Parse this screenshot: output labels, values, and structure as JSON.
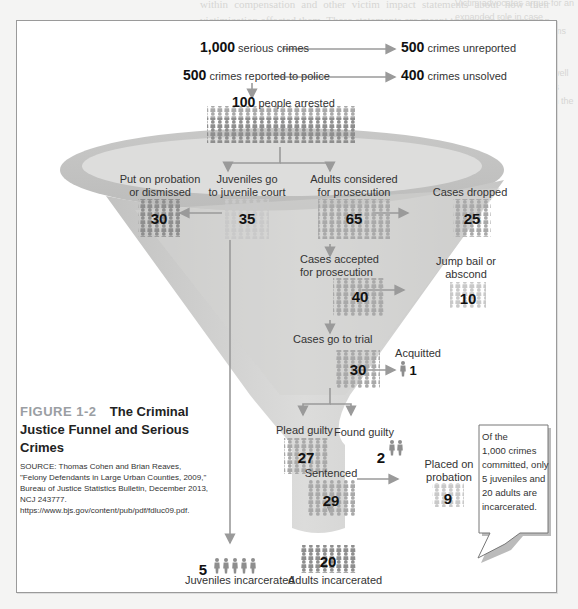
{
  "background_page": {
    "visible": "faded bleed-through of surrounding book page text"
  },
  "figure": {
    "number": "FIGURE 1-2",
    "title": "The Criminal Justice Funnel and Serious Crimes",
    "source": "SOURCE: Thomas Cohen and Brian Reaves, \"Felony Defendants in Large Urban Counties, 2009,\" Bureau of Justice Statistics Bulletin, December 2013, NCJ 243777. https://www.bjs.gov/content/pub/pdf/fdluc09.pdf."
  },
  "flow": {
    "serious_crimes": {
      "value": "1,000",
      "label": "serious crimes"
    },
    "unreported": {
      "value": "500",
      "label": "crimes unreported"
    },
    "reported": {
      "value": "500",
      "label": "crimes reported to police"
    },
    "unsolved": {
      "value": "400",
      "label": "crimes unsolved"
    },
    "arrested": {
      "value": "100",
      "label": "people arrested"
    },
    "probation_dismissed": {
      "value": "30",
      "label_line1": "Put on probation",
      "label_line2": "or dismissed"
    },
    "juvenile_court": {
      "value": "35",
      "label_line1": "Juveniles go",
      "label_line2": "to juvenile court"
    },
    "adults_considered": {
      "value": "65",
      "label_line1": "Adults considered",
      "label_line2": "for prosecution"
    },
    "cases_dropped": {
      "value": "25",
      "label": "Cases dropped"
    },
    "cases_accepted": {
      "value": "40",
      "label_line1": "Cases accepted",
      "label_line2": "for prosecution"
    },
    "jump_bail": {
      "value": "10",
      "label_line1": "Jump bail or",
      "label_line2": "abscond"
    },
    "go_to_trial": {
      "value": "30",
      "label": "Cases go to trial"
    },
    "acquitted": {
      "value": "1",
      "label": "Acquitted"
    },
    "plead_guilty": {
      "value": "27",
      "label": "Plead guilty"
    },
    "found_guilty": {
      "value": "2",
      "label": "Found guilty"
    },
    "sentenced": {
      "value": "29",
      "label": "Sentenced"
    },
    "placed_on_probation": {
      "value": "9",
      "label_line1": "Placed on",
      "label_line2": "probation"
    },
    "adults_incarcerated": {
      "value": "20",
      "label": "Adults incarcerated"
    },
    "juveniles_incarcerated": {
      "value": "5",
      "label": "Juveniles incarcerated"
    }
  },
  "callout": {
    "lines": [
      "Of the",
      "1,000 crimes",
      "committed, only",
      "5 juveniles and",
      "20 adults are",
      "incarcerated."
    ]
  },
  "colors": {
    "funnel": "#d0d0cf",
    "funnel_rim": "#c4c4c3",
    "person_dark": "#8e8e8e",
    "person_light": "#c9c9c9",
    "arrow": "#9a9a9a",
    "frame_border": "#9a9a9a",
    "figure_number": "#9a9ea3"
  }
}
